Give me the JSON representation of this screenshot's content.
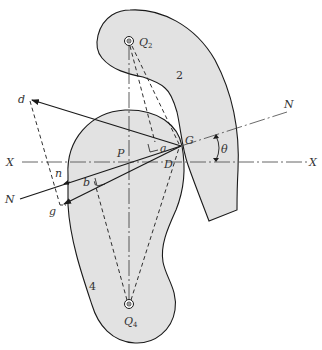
{
  "figure": {
    "kind": "cam-follower kinematic diagram",
    "colors": {
      "body_fill": "#e2e2e2",
      "stroke": "#1a1a1a",
      "background": "#ffffff"
    }
  },
  "bodies": [
    {
      "id": "2",
      "label": "2"
    },
    {
      "id": "4",
      "label": "4"
    }
  ],
  "pivots": [
    {
      "id": "Q2",
      "letter": "Q",
      "sub": "2"
    },
    {
      "id": "Q4",
      "letter": "Q",
      "sub": "4"
    }
  ],
  "points": {
    "G": "G",
    "D": "D",
    "P": "P",
    "a": "a",
    "b": "b",
    "d": "d",
    "n": "n",
    "g": "g"
  },
  "axes": {
    "x_left": "X",
    "x_right": "X",
    "n_left": "N",
    "n_right": "N"
  },
  "angle": {
    "symbol": "θ"
  }
}
